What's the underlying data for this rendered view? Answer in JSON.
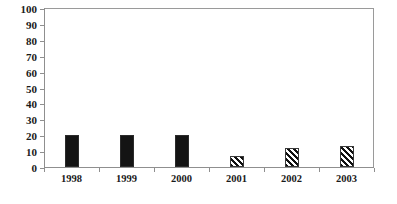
{
  "chart_data": {
    "type": "bar",
    "title": "",
    "xlabel": "",
    "ylabel": "",
    "categories": [
      "1998",
      "1999",
      "2000",
      "2001",
      "2002",
      "2003"
    ],
    "values": [
      20,
      20,
      20,
      7,
      12,
      13
    ],
    "ylim": [
      0,
      100
    ],
    "ytick_labels": [
      "0",
      "10",
      "20",
      "30",
      "40",
      "50",
      "60",
      "70",
      "80",
      "90",
      "100"
    ],
    "ytick_values": [
      0,
      10,
      20,
      30,
      40,
      50,
      60,
      70,
      80,
      90,
      100
    ],
    "grid": false,
    "legend": false,
    "bars": [
      {
        "category": "1998",
        "value": 20,
        "style": "solid-black"
      },
      {
        "category": "1999",
        "value": 20,
        "style": "solid-black"
      },
      {
        "category": "2000",
        "value": 20,
        "style": "solid-black"
      },
      {
        "category": "2001",
        "value": 7,
        "style": "diagonal-hatch"
      },
      {
        "category": "2002",
        "value": 12,
        "style": "diagonal-hatch"
      },
      {
        "category": "2003",
        "value": 13,
        "style": "diagonal-hatch"
      }
    ],
    "colors": {
      "solid_fill": "#141414",
      "hatch_line": "#111111",
      "hatch_background": "#ffffff",
      "axis": "#8f8f8f",
      "frame": "#9a9a9a",
      "text": "#1a1a1a",
      "background": "#ffffff"
    }
  }
}
